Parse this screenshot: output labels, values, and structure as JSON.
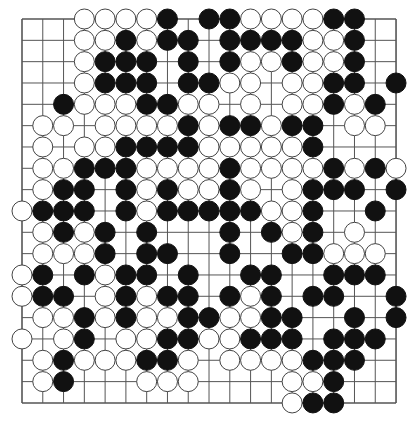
{
  "board": {
    "size": 19,
    "origin": {
      "x": 22,
      "y": 19
    },
    "spacing": {
      "x": 20.78,
      "y": 21.33
    },
    "stone_radius": 10,
    "colors": {
      "line": "#555555",
      "black": "#111111",
      "white": "#ffffff",
      "white_stroke": "#444444"
    },
    "rows": [
      {
        "white": [
          3,
          4,
          5,
          6,
          11,
          12,
          13,
          14
        ],
        "black": [
          7,
          9,
          10,
          15,
          16
        ]
      },
      {
        "white": [
          3,
          4,
          6,
          14,
          15
        ],
        "black": [
          5,
          7,
          8,
          10,
          11,
          12,
          13,
          16
        ]
      },
      {
        "white": [
          3,
          11,
          12,
          14,
          15
        ],
        "black": [
          4,
          5,
          6,
          8,
          10,
          13,
          16
        ]
      },
      {
        "white": [
          3,
          10,
          11,
          13,
          14
        ],
        "black": [
          4,
          5,
          6,
          8,
          9,
          15,
          16,
          18
        ]
      },
      {
        "white": [
          3,
          4,
          5,
          8,
          9,
          11,
          13,
          14,
          16
        ],
        "black": [
          2,
          6,
          7,
          15,
          17
        ]
      },
      {
        "white": [
          1,
          2,
          4,
          5,
          6,
          7,
          9,
          12,
          16,
          17
        ],
        "black": [
          8,
          10,
          11,
          13,
          14
        ]
      },
      {
        "white": [
          1,
          3,
          4,
          9,
          10,
          11,
          12,
          13
        ],
        "black": [
          5,
          6,
          7,
          8,
          14
        ]
      },
      {
        "white": [
          1,
          2,
          6,
          7,
          8,
          9,
          11,
          12,
          13,
          14,
          16,
          18
        ],
        "black": [
          3,
          4,
          5,
          10,
          15,
          17
        ]
      },
      {
        "white": [
          1,
          6,
          8,
          9,
          11,
          13
        ],
        "black": [
          2,
          3,
          5,
          7,
          10,
          14,
          15,
          16,
          18
        ]
      },
      {
        "white": [
          0,
          6,
          12,
          13
        ],
        "black": [
          1,
          2,
          3,
          5,
          7,
          8,
          9,
          10,
          11,
          14,
          17
        ]
      },
      {
        "white": [
          1,
          3,
          13,
          16
        ],
        "black": [
          2,
          4,
          6,
          10,
          12,
          14
        ]
      },
      {
        "white": [
          1,
          2,
          3,
          15,
          16,
          17
        ],
        "black": [
          4,
          6,
          7,
          10,
          13,
          14
        ]
      },
      {
        "white": [
          0,
          4
        ],
        "black": [
          1,
          3,
          5,
          6,
          8,
          11,
          12,
          15,
          16,
          17
        ]
      },
      {
        "white": [
          0,
          4,
          6,
          11
        ],
        "black": [
          1,
          2,
          5,
          7,
          8,
          10,
          12,
          14,
          15,
          18
        ]
      },
      {
        "white": [
          1,
          2,
          4,
          6,
          7,
          10,
          11
        ],
        "black": [
          3,
          5,
          8,
          9,
          12,
          13,
          16,
          18
        ]
      },
      {
        "white": [
          0,
          2,
          5,
          6,
          9,
          10
        ],
        "black": [
          3,
          7,
          8,
          11,
          12,
          13,
          15,
          16,
          17
        ]
      },
      {
        "white": [
          1,
          3,
          4,
          5,
          8,
          10,
          11,
          12,
          13
        ],
        "black": [
          2,
          6,
          7,
          14,
          15,
          16
        ]
      },
      {
        "white": [
          1,
          6,
          7,
          8,
          13,
          14
        ],
        "black": [
          2,
          15
        ]
      },
      {
        "white": [
          13
        ],
        "black": [
          14,
          15
        ]
      }
    ]
  }
}
